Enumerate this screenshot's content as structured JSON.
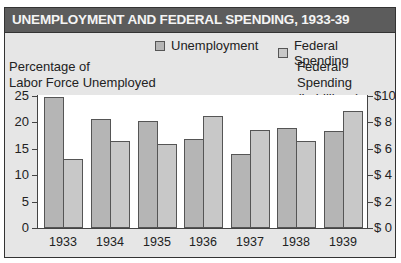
{
  "chart_data": {
    "type": "bar",
    "title": "UNEMPLOYMENT AND FEDERAL SPENDING, 1933-39",
    "categories": [
      "1933",
      "1934",
      "1935",
      "1936",
      "1937",
      "1938",
      "1939"
    ],
    "series": [
      {
        "name": "Unemployment",
        "axis": "left",
        "unit": "percent",
        "color": "#b5b5b5",
        "values": [
          24.9,
          20.7,
          20.3,
          16.9,
          14.0,
          19.0,
          18.4
        ]
      },
      {
        "name": "Federal Spending",
        "axis": "right",
        "unit": "billions USD",
        "color": "#c8c8c8",
        "values": [
          5.2,
          6.6,
          6.4,
          8.5,
          7.4,
          6.6,
          8.9
        ]
      }
    ],
    "ylabel_left": "Percentage of Labor Force Unemployed",
    "ylabel_right": "Federal Spending (In billions)",
    "ylim_left": [
      0,
      25
    ],
    "ylim_right": [
      0,
      10
    ],
    "yticks_left": [
      "0",
      "5",
      "10",
      "15",
      "20",
      "25"
    ],
    "yticks_right": [
      "$ 0",
      "$ 2",
      "$ 4",
      "$ 6",
      "$ 8",
      "$10"
    ],
    "grid": false,
    "legend_position": "top-right"
  },
  "title": "UNEMPLOYMENT AND FEDERAL SPENDING, 1933-39",
  "legend": {
    "unemployment": "Unemployment",
    "federal": "Federal Spending"
  },
  "left_label": {
    "line1": "Percentage of",
    "line2": "Labor Force Unemployed"
  },
  "right_label": {
    "line1": "Federal Spending",
    "line2": "(In billions)"
  },
  "colors": {
    "unemployment": "#b5b5b5",
    "federal": "#c8c8c8",
    "title_bg": "#5c5c5c",
    "panel_bg": "#e6e6e6"
  }
}
